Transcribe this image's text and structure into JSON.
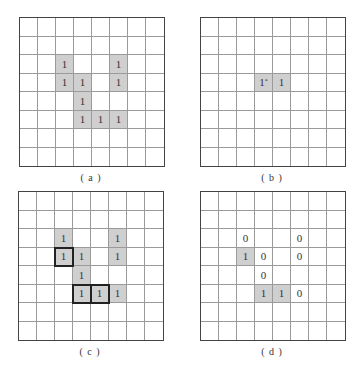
{
  "panels": [
    {
      "id": "a",
      "caption": "( a )",
      "origin": [
        19,
        17
      ],
      "rows": 8,
      "cols": 8,
      "cells": [
        {
          "r": 2,
          "c": 2,
          "text": "1",
          "shaded": true
        },
        {
          "r": 2,
          "c": 5,
          "text": "1",
          "shaded": true
        },
        {
          "r": 3,
          "c": 2,
          "text": "1",
          "shaded": true
        },
        {
          "r": 3,
          "c": 3,
          "text": "1",
          "shaded": true
        },
        {
          "r": 3,
          "c": 5,
          "text": "1",
          "shaded": true
        },
        {
          "r": 4,
          "c": 3,
          "text": "1",
          "shaded": true
        },
        {
          "r": 5,
          "c": 3,
          "text": "1",
          "shaded": true
        },
        {
          "r": 5,
          "c": 4,
          "text": "1",
          "shaded": true
        },
        {
          "r": 5,
          "c": 5,
          "text": "1",
          "shaded": true
        }
      ]
    },
    {
      "id": "b",
      "caption": "( b )",
      "origin": [
        200,
        17
      ],
      "rows": 8,
      "cols": 8,
      "cells": [
        {
          "r": 3,
          "c": 3,
          "text": "1",
          "sup": "*",
          "shaded": true
        },
        {
          "r": 3,
          "c": 4,
          "text": "1",
          "shaded": true
        }
      ]
    },
    {
      "id": "c",
      "caption": "( c )",
      "origin": [
        18,
        191
      ],
      "rows": 8,
      "cols": 8,
      "cells": [
        {
          "r": 2,
          "c": 2,
          "text": "1",
          "shaded": true
        },
        {
          "r": 2,
          "c": 5,
          "text": "1",
          "shaded": true
        },
        {
          "r": 3,
          "c": 2,
          "text": "1",
          "shaded": true,
          "bold": true
        },
        {
          "r": 3,
          "c": 3,
          "text": "1",
          "shaded": true
        },
        {
          "r": 3,
          "c": 5,
          "text": "1",
          "shaded": true
        },
        {
          "r": 4,
          "c": 3,
          "text": "1",
          "shaded": true
        },
        {
          "r": 5,
          "c": 3,
          "text": "1",
          "shaded": true,
          "bold": true
        },
        {
          "r": 5,
          "c": 4,
          "text": "1",
          "shaded": true,
          "bold": true
        },
        {
          "r": 5,
          "c": 5,
          "text": "1",
          "shaded": true
        }
      ]
    },
    {
      "id": "d",
      "caption": "( d )",
      "origin": [
        200,
        191
      ],
      "rows": 8,
      "cols": 8,
      "cells": [
        {
          "r": 2,
          "c": 2,
          "text": "0",
          "shaded": false
        },
        {
          "r": 2,
          "c": 5,
          "text": "0",
          "shaded": false
        },
        {
          "r": 3,
          "c": 2,
          "text": "1",
          "shaded": true
        },
        {
          "r": 3,
          "c": 3,
          "text": "0",
          "shaded": false
        },
        {
          "r": 3,
          "c": 5,
          "text": "0",
          "shaded": false
        },
        {
          "r": 4,
          "c": 3,
          "text": "0",
          "shaded": false
        },
        {
          "r": 5,
          "c": 3,
          "text": "1",
          "shaded": true
        },
        {
          "r": 5,
          "c": 4,
          "text": "1",
          "shaded": true
        },
        {
          "r": 5,
          "c": 5,
          "text": "0",
          "shaded": false
        }
      ]
    }
  ],
  "colors": {
    "shaded": "#cfcfcf",
    "grid_line": "#9a9a9a",
    "border": "#444444",
    "bold_outline": "#222222"
  }
}
